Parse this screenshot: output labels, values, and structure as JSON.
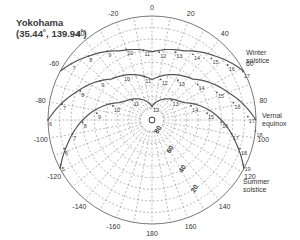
{
  "title": {
    "location": "Yokohama",
    "coords": "(35.44˚, 139.94˚)"
  },
  "diagram": {
    "type": "sun-path",
    "center": [
      152,
      120
    ],
    "radius": 104,
    "azimuth_labels": [
      "0",
      "20",
      "40",
      "60",
      "80",
      "100",
      "120",
      "140",
      "160",
      "180",
      "-160",
      "-140",
      "-120",
      "-100",
      "-80",
      "-60",
      "-40",
      "-20"
    ],
    "azimuth_values": [
      0,
      20,
      40,
      60,
      80,
      100,
      120,
      140,
      160,
      180,
      -160,
      -140,
      -120,
      -100,
      -80,
      -60,
      -40,
      -20
    ],
    "altitude_labels": [
      "80",
      "60",
      "40",
      "20"
    ],
    "altitude_values": [
      80,
      60,
      40,
      20
    ],
    "curves": [
      {
        "name": "Winter solstice",
        "label_line1": "Winter",
        "label_line2": "solstice",
        "hours": [
          "7",
          "8",
          "9",
          "10",
          "11",
          "12",
          "13",
          "14",
          "15",
          "16",
          "17"
        ]
      },
      {
        "name": "Vernal equinox",
        "label_line1": "Vernal",
        "label_line2": "equinox",
        "hours": [
          "6",
          "7",
          "8",
          "9",
          "10",
          "11",
          "12",
          "13",
          "14",
          "15",
          "16",
          "17",
          "18"
        ]
      },
      {
        "name": "Summer solstice",
        "label_line1": "Summer",
        "label_line2": "solstice",
        "hours": [
          "5",
          "6",
          "7",
          "8",
          "9",
          "10",
          "11",
          "12",
          "13",
          "14",
          "15",
          "16",
          "17",
          "18",
          "19"
        ]
      }
    ],
    "colors": {
      "outline": "#777777",
      "grid": "#8a8a8a",
      "curve": "#555555",
      "text": "#333333"
    }
  }
}
